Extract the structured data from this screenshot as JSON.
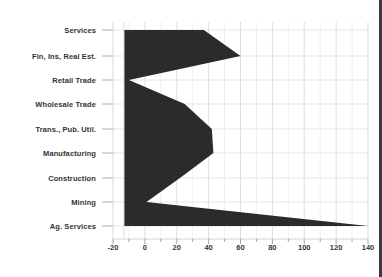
{
  "chart_data": {
    "type": "area",
    "orientation": "horizontal",
    "title": "",
    "subtitle": "",
    "xlabel": "",
    "ylabel": "",
    "categories": [
      "Services",
      "Fin, Ins, Real Est.",
      "Retail Trade",
      "Wholesale Trade",
      "Trans., Pub. Util.",
      "Manufacturing",
      "Construction",
      "Mining",
      "Ag. Services"
    ],
    "values": [
      37,
      60,
      -10,
      25,
      42,
      43,
      22,
      1,
      140
    ],
    "series": [
      {
        "name": "value",
        "values": [
          37,
          60,
          -10,
          25,
          42,
          43,
          22,
          1,
          140
        ]
      }
    ],
    "xlim": [
      -20,
      140
    ],
    "xticks": [
      -20,
      0,
      20,
      40,
      60,
      80,
      100,
      120,
      140
    ],
    "xtick_labels": [
      "-20",
      "0",
      "20",
      "40",
      "60",
      "80",
      "100",
      "120",
      "140"
    ],
    "minor_tick_step": 10,
    "grid": true,
    "grid_color": "#d9d9d9",
    "legend": false,
    "legend_position": "none",
    "fill_color": "#2b2b2b",
    "baseline": 0,
    "axis_label_color": "#333333"
  },
  "geometry": {
    "x_zero_px": 124,
    "x_min_px": 113,
    "x_max_px": 368,
    "plot_top_px": 22,
    "plot_bottom_px": 239,
    "row_y_px": [
      30,
      56,
      80,
      104,
      129,
      153,
      178,
      202,
      226
    ]
  }
}
